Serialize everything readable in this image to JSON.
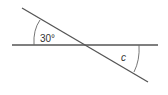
{
  "diagram": {
    "type": "intersecting-lines-angles",
    "colors": {
      "line": "#555555",
      "arc": "#666666",
      "text": "#333333",
      "background": "#ffffff"
    },
    "lines": {
      "horizontal": {
        "x1": 12,
        "y1": 45,
        "x2": 158,
        "y2": 45
      },
      "transversal": {
        "x1": 22,
        "y1": 8,
        "x2": 148,
        "y2": 82
      }
    },
    "angles": [
      {
        "label": "30°",
        "position": "upper-left",
        "value_deg": 30
      },
      {
        "label": "c",
        "position": "lower-right",
        "value_deg": null
      }
    ]
  }
}
